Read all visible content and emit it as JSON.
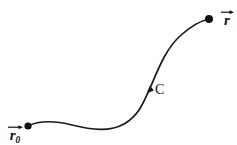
{
  "figure": {
    "title": "",
    "background_color": "#ffffff",
    "stroke_color": "#1a1a1a",
    "width": 237,
    "height": 145
  },
  "labels": {
    "start_point": {
      "name": "r0-vector-label",
      "base": "r",
      "subscript": "0",
      "accent": "vector-arrow",
      "x": 7,
      "y": 124
    },
    "end_point": {
      "name": "r-vector-label",
      "base": "r",
      "subscript": "",
      "accent": "vector-arrow",
      "x": 220,
      "y": 9
    },
    "curve": {
      "name": "curve-label",
      "text": "C",
      "x": 155,
      "y": 83
    }
  },
  "markers": {
    "start_dot": {
      "cx": 28,
      "cy": 126,
      "r": 3.6
    },
    "end_dot": {
      "cx": 209,
      "cy": 19,
      "r": 4.0
    },
    "direction_arrow": {
      "x": 150,
      "y": 88,
      "points_to": "up-right"
    }
  },
  "chart_data": {
    "type": "line",
    "title": "",
    "xlabel": "",
    "ylabel": "",
    "grid": false,
    "legend": "none",
    "xlim": [
      0,
      237
    ],
    "ylim": [
      145,
      0
    ],
    "series": [
      {
        "name": "path-C",
        "description": "smooth S-shaped curve from r0 to r",
        "path": "M 28 126 C 40 120, 56 121, 72 125 C 92 130, 110 132, 124 124 C 138 116, 143 104, 150 88 C 158 70, 165 50, 180 36 C 190 27, 199 21, 209 19",
        "points": [
          [
            28,
            126
          ],
          [
            45,
            122
          ],
          [
            62,
            123
          ],
          [
            80,
            127
          ],
          [
            98,
            130
          ],
          [
            115,
            129
          ],
          [
            128,
            121
          ],
          [
            140,
            106
          ],
          [
            150,
            88
          ],
          [
            160,
            66
          ],
          [
            170,
            50
          ],
          [
            182,
            35
          ],
          [
            195,
            25
          ],
          [
            209,
            19
          ]
        ]
      }
    ]
  }
}
